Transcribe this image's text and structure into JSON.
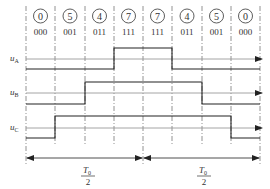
{
  "diagram": {
    "vectors": [
      {
        "index": "0",
        "code": "000"
      },
      {
        "index": "5",
        "code": "001"
      },
      {
        "index": "4",
        "code": "011"
      },
      {
        "index": "7",
        "code": "111"
      },
      {
        "index": "7",
        "code": "111"
      },
      {
        "index": "4",
        "code": "011"
      },
      {
        "index": "5",
        "code": "001"
      },
      {
        "index": "0",
        "code": "000"
      }
    ],
    "signals": [
      {
        "name": "u",
        "sub": "A"
      },
      {
        "name": "u",
        "sub": "B"
      },
      {
        "name": "u",
        "sub": "C"
      }
    ],
    "period_labels": [
      {
        "numerator": "T",
        "numerator_sub": "0",
        "denominator": "2"
      },
      {
        "numerator": "T",
        "numerator_sub": "0",
        "denominator": "2"
      }
    ],
    "colors": {
      "line": "#222222",
      "axis": "#9a9a9a",
      "dashed": "#777777"
    }
  }
}
